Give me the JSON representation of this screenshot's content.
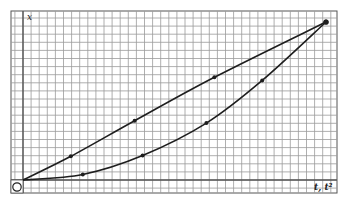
{
  "chart_data": {
    "type": "line",
    "title": "",
    "xlabel": "t, t²",
    "ylabel": "x",
    "origin_label": "O",
    "grid": true,
    "legend": null,
    "axis_units": "arbitrary (graph-paper divisions)",
    "xlim": [
      0,
      38
    ],
    "ylim": [
      0,
      20
    ],
    "series": [
      {
        "name": "x vs t (upper, nearly straight line)",
        "x": [
          0,
          6,
          14,
          24,
          38
        ],
        "y": [
          0,
          3,
          7.5,
          13,
          20
        ]
      },
      {
        "name": "x vs t² (lower, curved)",
        "x": [
          0,
          7.5,
          15,
          23,
          30,
          38
        ],
        "y": [
          0,
          0.7,
          3.1,
          7.2,
          12.6,
          20
        ]
      }
    ],
    "colors": {
      "grid_minor": "#9a9a9a",
      "grid_major": "#555555",
      "line": "#1e1e1e",
      "background": "#ffffff"
    }
  }
}
